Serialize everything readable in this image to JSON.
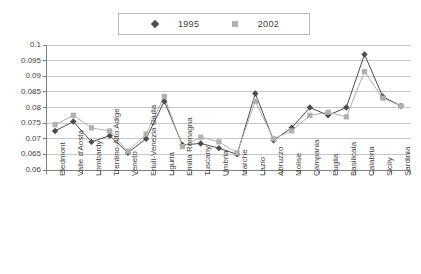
{
  "chart_data": {
    "type": "line",
    "title": "",
    "subtitle": "",
    "xlabel": "",
    "ylabel": "",
    "ylim": [
      0.06,
      0.1
    ],
    "ytick_labels": [
      "0.1",
      "0.095",
      "0.09",
      "0.085",
      "0.08",
      "0.075",
      "0.07",
      "0.065",
      "0.06"
    ],
    "ytick_values": [
      0.1,
      0.095,
      0.09,
      0.085,
      0.08,
      0.075,
      0.07,
      0.065,
      0.06
    ],
    "grid": "horizontal",
    "legend_position": "top-center",
    "categories": [
      "Piedmont",
      "Valle d'Aosta",
      "Lombardy",
      "Trentino-Alto Adige",
      "Veneto",
      "Friuli-Venezia Giulia",
      "Liguria",
      "Emilia Romagna",
      "Tuscany",
      "Umbria",
      "Marche",
      "Lazio",
      "Abruzzo",
      "Molise",
      "Campania",
      "Puglia",
      "Basilicata",
      "Calabria",
      "Sicily",
      "Sardinia"
    ],
    "series": [
      {
        "name": "1995",
        "color": "#4d4d4d",
        "marker": "diamond",
        "values": [
          0.0725,
          0.0755,
          0.069,
          0.071,
          0.0655,
          0.07,
          0.082,
          0.068,
          0.0685,
          0.067,
          0.065,
          0.0845,
          0.0695,
          0.0735,
          0.08,
          0.0775,
          0.08,
          0.097,
          0.0835,
          0.0805
        ]
      },
      {
        "name": "2002",
        "color": "#b0b0b0",
        "marker": "square",
        "values": [
          0.0745,
          0.0775,
          0.0735,
          0.0725,
          0.066,
          0.0715,
          0.0835,
          0.0675,
          0.0705,
          0.069,
          0.0655,
          0.082,
          0.07,
          0.0725,
          0.0775,
          0.0785,
          0.077,
          0.0915,
          0.083,
          0.0805
        ]
      }
    ]
  },
  "legend": {
    "entries": [
      {
        "label": "1995"
      },
      {
        "label": "2002"
      }
    ]
  },
  "colors": {
    "series_1995": "#4d4d4d",
    "series_2002": "#b0b0b0",
    "grid": "#b9b9b9",
    "axis": "#808080",
    "text": "#3f3f3f",
    "background": "#ffffff"
  }
}
